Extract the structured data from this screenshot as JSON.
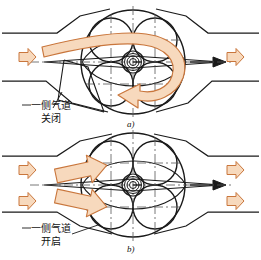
{
  "figure": {
    "type": "technical-cross-section-diagram",
    "panels": [
      {
        "id": "a",
        "caption": "a)",
        "annotation_line1": "一侧气道",
        "annotation_line2": "关闭",
        "annotation_meaning": "one side air passage closed",
        "inlet_arrow_count": 1,
        "outlet_arrow_count": 1,
        "swirl_arrow": "large curved hook arrow indicating swirl rotation",
        "lobe_count": 4
      },
      {
        "id": "b",
        "caption": "b)",
        "annotation_line1": "一侧气道",
        "annotation_line2": "开启",
        "annotation_meaning": "one side air passage open",
        "inlet_arrow_count": 2,
        "outlet_arrow_count": 2,
        "straight_flow_arrow_count": 2,
        "lobe_count": 4
      }
    ]
  },
  "colors": {
    "arrow_fill": "#f7d9bd",
    "arrow_stroke": "#c9763c",
    "line": "#1a1a1a",
    "centerline": "#555555",
    "background": "#ffffff"
  }
}
